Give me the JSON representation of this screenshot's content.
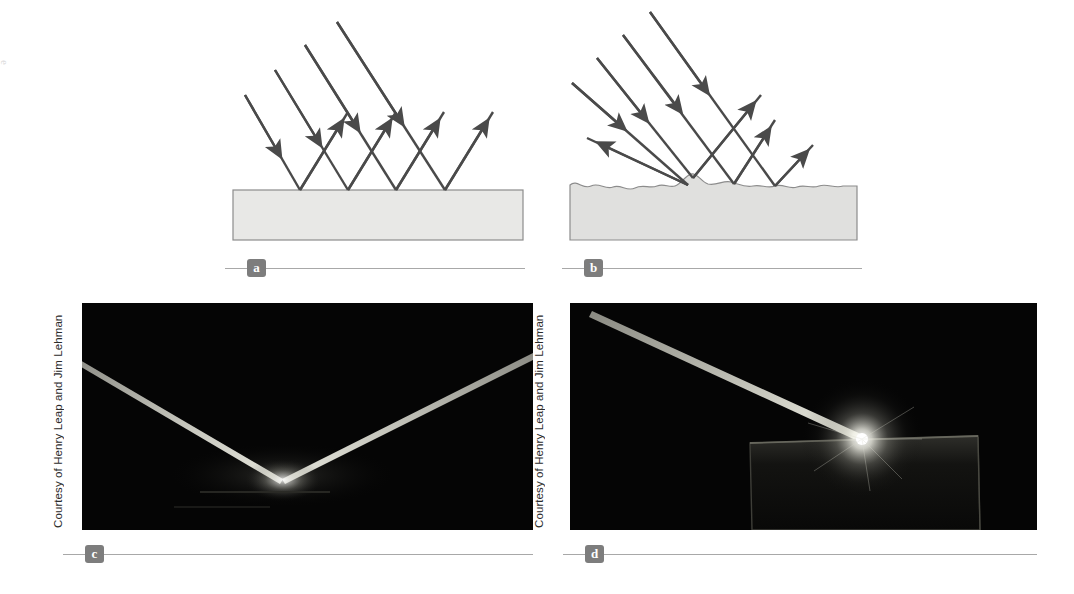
{
  "figure": {
    "background_color": "#ffffff",
    "scan_artifact_text": "e"
  },
  "panels": [
    {
      "id": "a",
      "label": "a",
      "kind": "diagram",
      "description": "Specular reflection from a smooth surface: parallel incident rays reflect as parallel rays",
      "surface": "smooth",
      "surface_fill": "#e8e8e6",
      "surface_stroke": "#8c8c8c",
      "ray_color": "#4a4a4a",
      "incident_ray_count": 4,
      "reflected_ray_count": 4
    },
    {
      "id": "b",
      "label": "b",
      "kind": "diagram",
      "description": "Diffuse reflection from a rough surface: parallel incident rays reflect in many directions",
      "surface": "rough",
      "surface_fill": "#e0e0de",
      "surface_stroke": "#8c8c8c",
      "ray_color": "#4a4a4a",
      "incident_ray_count": 4,
      "reflected_ray_count": 4
    },
    {
      "id": "c",
      "label": "c",
      "kind": "photo",
      "description": "Photograph of a laser beam striking a mirror and reflecting specularly in a sharp V",
      "credit": "Courtesy of Henry Leap and Jim Lehman",
      "background_color": "#050505",
      "beam_color": "#d8d8cf"
    },
    {
      "id": "d",
      "label": "d",
      "kind": "photo",
      "description": "Photograph of a laser beam striking a rough surface and scattering diffusely as a bright burst",
      "credit": "Courtesy of Henry Leap and Jim Lehman",
      "background_color": "#050505",
      "beam_color": "#cfcfc6",
      "glow_color": "#ffffff"
    }
  ],
  "caption_rule": {
    "line_color": "#a8a8a8",
    "badge_background": "#7d7d7d",
    "badge_text_color": "#ffffff"
  }
}
